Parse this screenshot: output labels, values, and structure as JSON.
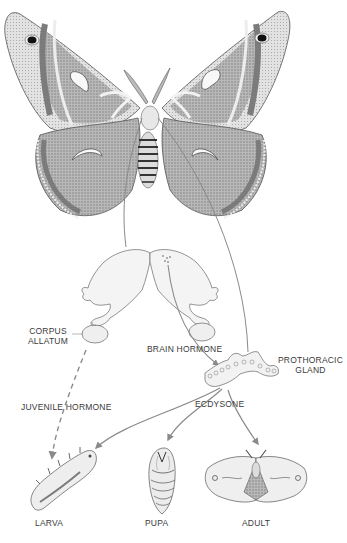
{
  "diagram": {
    "type": "biological-process-illustration",
    "colors": {
      "ink": "#3a3a3a",
      "arrow": "#8a8a8a",
      "wing_dark": "#6e6e6e",
      "wing_mid": "#a8a8a8",
      "wing_light": "#e4e4e4",
      "background": "#ffffff"
    },
    "nodes": [
      {
        "id": "adult_moth_top",
        "label": "",
        "kind": "illustration"
      },
      {
        "id": "brain",
        "label": "",
        "kind": "illustration"
      },
      {
        "id": "corpus_allatum",
        "label_lines": [
          "CORPUS",
          "ALLATUM"
        ]
      },
      {
        "id": "brain_hormone",
        "label": "BRAIN HORMONE"
      },
      {
        "id": "prothoracic_gland",
        "label_lines": [
          "PROTHORACIC",
          "GLAND"
        ]
      },
      {
        "id": "juvenile_hormone",
        "label": "JUVENILE HORMONE"
      },
      {
        "id": "ecdysone",
        "label": "ECDYSONE"
      },
      {
        "id": "larva",
        "label": "LARVA"
      },
      {
        "id": "pupa",
        "label": "PUPA"
      },
      {
        "id": "adult",
        "label": "ADULT"
      }
    ],
    "edges": [
      {
        "from": "adult_moth_top",
        "to": "brain",
        "style": "solid"
      },
      {
        "from": "adult_moth_top",
        "to": "prothoracic_gland",
        "style": "solid"
      },
      {
        "from": "brain",
        "to": "prothoracic_gland",
        "label": "BRAIN HORMONE",
        "style": "solid-arrow"
      },
      {
        "from": "corpus_allatum",
        "to": "larva",
        "label": "JUVENILE HORMONE",
        "style": "dashed-arrow"
      },
      {
        "from": "prothoracic_gland",
        "to": "larva",
        "label": "ECDYSONE",
        "style": "solid-arrow"
      },
      {
        "from": "prothoracic_gland",
        "to": "pupa",
        "label": "ECDYSONE",
        "style": "solid-arrow"
      },
      {
        "from": "prothoracic_gland",
        "to": "adult",
        "label": "ECDYSONE",
        "style": "solid-arrow"
      }
    ]
  },
  "labels": {
    "corpus": "CORPUS",
    "allatum": "ALLATUM",
    "brain_hormone": "BRAIN HORMONE",
    "prothoracic": "PROTHORACIC",
    "gland": "GLAND",
    "juvenile_hormone": "JUVENILE HORMONE",
    "ecdysone": "ECDYSONE",
    "larva": "LARVA",
    "pupa": "PUPA",
    "adult": "ADULT"
  }
}
